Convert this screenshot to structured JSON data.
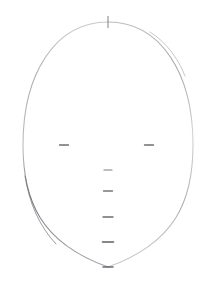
{
  "drawing": {
    "title": "Face Construction Guide",
    "medium": "pencil-sketch",
    "background_color": "#ffffff",
    "stroke_color": "#8f8f96",
    "accent_stroke_color": "#5a5a62",
    "canvas": {
      "width": 211,
      "height": 294
    }
  },
  "chart_data": {
    "type": "diagram",
    "xlabel": "",
    "ylabel": "",
    "grid": false,
    "legend": null,
    "xlim": [
      0,
      211
    ],
    "ylim": [
      0,
      294
    ],
    "elements": [
      {
        "name": "face-oval",
        "kind": "ellipse-egg",
        "center_x": 108,
        "center_y": 145,
        "radius_x": 85,
        "radius_y": 123,
        "top_y": 22,
        "bottom_y": 267,
        "left_x": 23,
        "right_x": 193,
        "note": "egg shaped cranium tapering to chin"
      },
      {
        "name": "vertical-centerline",
        "kind": "line",
        "x1": 108,
        "y1": 22,
        "x2": 108,
        "y2": 272
      },
      {
        "name": "horizontal-eyeline",
        "kind": "line",
        "x1": 22,
        "y1": 145,
        "x2": 194,
        "y2": 145
      }
    ],
    "tick_marks": [
      {
        "name": "crown-tick",
        "axis": "vertical",
        "x": 108,
        "y": 22,
        "length": 11,
        "weight": 1.1
      },
      {
        "name": "eye-tick-left",
        "axis": "horizontal",
        "x": 64,
        "y": 145,
        "length": 9,
        "weight": 1.3
      },
      {
        "name": "eye-tick-right",
        "axis": "horizontal",
        "x": 149,
        "y": 145,
        "length": 9,
        "weight": 1.3
      },
      {
        "name": "brow-tick",
        "axis": "horizontal",
        "x": 108,
        "y": 170,
        "length": 8,
        "weight": 1.2
      },
      {
        "name": "nose-tick",
        "axis": "horizontal",
        "x": 108,
        "y": 191,
        "length": 9,
        "weight": 1.3
      },
      {
        "name": "mouth-tick",
        "axis": "horizontal",
        "x": 108,
        "y": 217,
        "length": 10,
        "weight": 1.4
      },
      {
        "name": "chin-line-tick",
        "axis": "horizontal",
        "x": 108,
        "y": 242,
        "length": 11,
        "weight": 1.6
      },
      {
        "name": "chin-point-tick",
        "axis": "horizontal",
        "x": 108,
        "y": 267,
        "length": 10,
        "weight": 1.5
      }
    ],
    "proportion_labels": []
  }
}
